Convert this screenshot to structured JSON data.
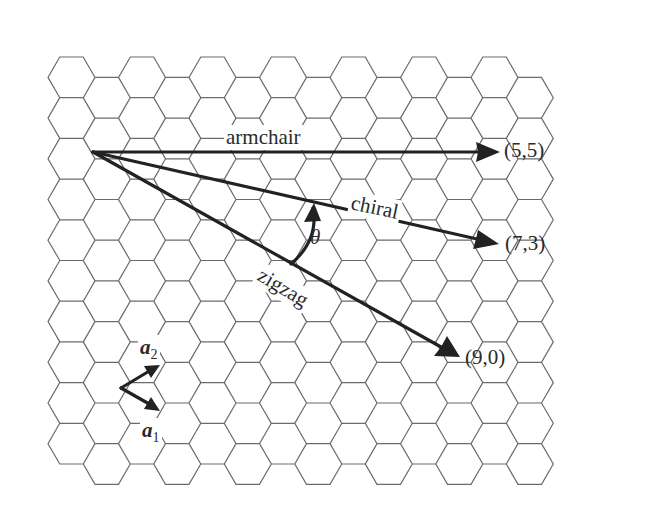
{
  "figure": {
    "lattice": "hexagonal",
    "vectors": [
      {
        "name": "armchair",
        "label": "armchair",
        "endpoint": "(5,5)"
      },
      {
        "name": "chiral",
        "label": "chiral",
        "endpoint": "(7,3)"
      },
      {
        "name": "zigzag",
        "label": "zigzag",
        "endpoint": "(9,0)"
      }
    ],
    "angle_label": "θ",
    "basis": {
      "a1": {
        "symbol": "a",
        "sub": "1"
      },
      "a2": {
        "symbol": "a",
        "sub": "2"
      }
    }
  }
}
